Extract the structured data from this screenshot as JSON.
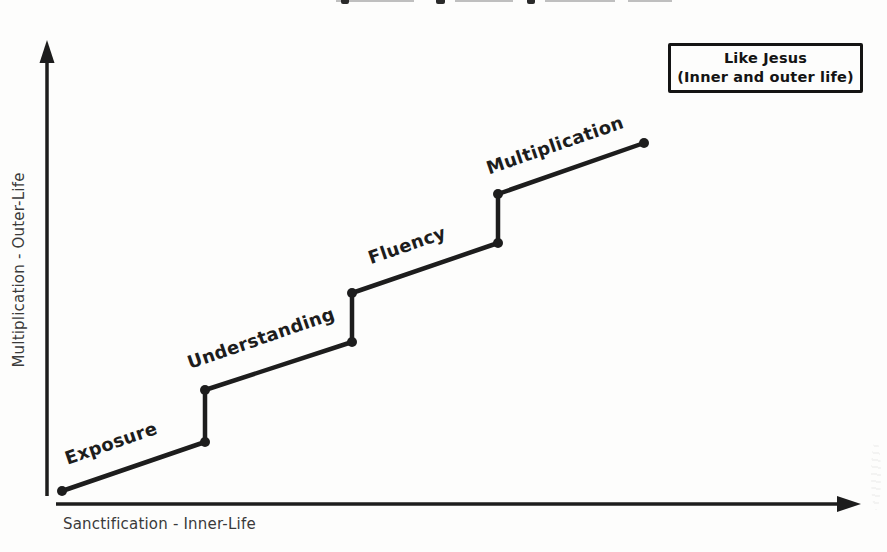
{
  "legend_box": {
    "line1": "Like Jesus",
    "line2": "(Inner and outer life)"
  },
  "chart_data": {
    "type": "line",
    "style": "staircase-step-growth",
    "title": "",
    "xlabel": "Sanctification - Inner-Life",
    "ylabel": "Multiplication - Outer-Life",
    "stages": [
      "Exposure",
      "Understanding",
      "Fluency",
      "Multiplication"
    ],
    "annotation": "Like Jesus (Inner and outer life)",
    "axes": {
      "x": {
        "label": "Sanctification - Inner-Life",
        "arrow": true
      },
      "y": {
        "label": "Multiplication - Outer-Life",
        "arrow": true
      }
    },
    "vertices": [
      [
        62,
        491
      ],
      [
        205,
        442
      ],
      [
        205,
        390
      ],
      [
        352,
        342
      ],
      [
        352,
        293
      ],
      [
        498,
        243
      ],
      [
        498,
        194
      ],
      [
        644,
        143
      ]
    ],
    "stage_labels": [
      {
        "text": "Exposure",
        "x": 113,
        "y": 449,
        "angle": -19
      },
      {
        "text": "Understanding",
        "x": 263,
        "y": 344,
        "angle": -19
      },
      {
        "text": "Fluency",
        "x": 409,
        "y": 251,
        "angle": -19
      },
      {
        "text": "Multiplication",
        "x": 557,
        "y": 151,
        "angle": -19
      }
    ]
  }
}
